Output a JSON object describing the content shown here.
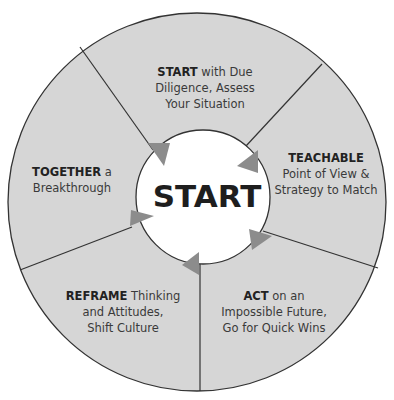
{
  "diagram": {
    "type": "cycle",
    "colors": {
      "ring_fill": "#d6d6d6",
      "center_fill": "#ffffff",
      "outline": "#333333",
      "arrow": "#8c8c8c",
      "text": "#3a3a3a",
      "bold_text": "#222222"
    },
    "center": {
      "label": "START"
    },
    "segments": [
      {
        "id": "start",
        "bold": "START",
        "lines": [
          " with Due",
          "Diligence, Assess",
          "Your Situation"
        ]
      },
      {
        "id": "teachable",
        "bold": "TEACHABLE",
        "lines": [
          "",
          "Point of View &",
          "Strategy to Match"
        ]
      },
      {
        "id": "act",
        "bold": "ACT",
        "lines": [
          " on an",
          "Impossible Future,",
          "Go for Quick Wins"
        ]
      },
      {
        "id": "reframe",
        "bold": "REFRAME",
        "lines": [
          " Thinking",
          "and Attitudes,",
          "Shift Culture"
        ]
      },
      {
        "id": "together",
        "bold": "TOGETHER",
        "lines": [
          " a",
          "Breakthrough"
        ]
      }
    ]
  }
}
